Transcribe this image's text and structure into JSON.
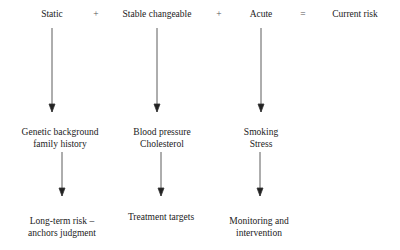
{
  "header": {
    "terms": [
      "Static",
      "Stable changeable",
      "Acute"
    ],
    "operators": [
      "+",
      "+",
      "="
    ],
    "result": "Current risk"
  },
  "examples": [
    [
      "Genetic background",
      "family history"
    ],
    [
      "Blood pressure",
      "Cholesterol"
    ],
    [
      "Smoking",
      "Stress"
    ]
  ],
  "implications": [
    [
      "Long-term risk –",
      "anchors judgment"
    ],
    [
      "Treatment targets"
    ],
    [
      "Monitoring and",
      "intervention"
    ]
  ],
  "colors": {
    "line": "#333333",
    "text": "#222222"
  }
}
